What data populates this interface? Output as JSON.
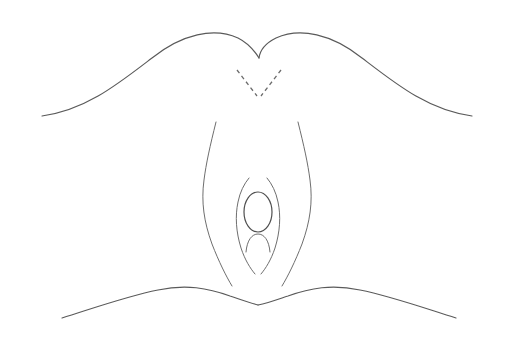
{
  "figure": {
    "title": "Perineal anatomy line diagram with midline instrument",
    "canvas": {
      "width": 514,
      "height": 348,
      "background": "#ffffff"
    },
    "caption": "",
    "labels": []
  },
  "palette": {
    "background": "#ffffff",
    "outline": "#5a5a5a",
    "outline_light": "#6e6e6e",
    "inner_detail": "#4f4f4f",
    "dashed_guide": "#6b6b6b",
    "instrument_core": "#e0703f",
    "instrument_edge": "#a83a18",
    "instrument_mid": "#c24f23"
  },
  "elements": {
    "thigh_upper_left": {
      "name": "Left upper thigh / mons contour",
      "path": "M 42 116 C 86 110 118 84 152 58 C 182 34 214 27 238 38 C 248 43 254 50 259 58"
    },
    "thigh_upper_right": {
      "name": "Right upper thigh / mons contour",
      "path": "M 472 116 C 428 110 396 84 362 58 C 332 34 300 27 276 38 C 266 43 260 50 259 58"
    },
    "thigh_lower_left": {
      "name": "Left lower thigh contour",
      "path": "M 62 318 C 100 306 128 296 158 290 C 186 284 208 288 230 296 C 242 300 250 303 258 305"
    },
    "thigh_lower_right": {
      "name": "Right lower thigh contour",
      "path": "M 456 318 C 418 306 390 296 360 290 C 332 284 310 288 288 296 C 276 300 268 303 258 305"
    },
    "labia_majora_left": {
      "name": "Left labia majora outer fold",
      "path": "M 216 122 C 210 146 206 164 204 180 C 201 202 204 222 212 244 C 219 262 226 276 232 286"
    },
    "labia_majora_right": {
      "name": "Right labia majora outer fold",
      "path": "M 298 122 C 304 146 308 164 310 180 C 313 202 310 222 302 244 C 295 262 288 276 282 286"
    },
    "labia_minora_left": {
      "name": "Left labia minora inner fold",
      "path": "M 249 178 C 244 184 240 192 238 202 C 235 216 236 232 241 248 C 245 260 250 268 255 274"
    },
    "labia_minora_right": {
      "name": "Right labia minora inner fold",
      "path": "M 267 178 C 272 184 276 192 278 202 C 281 216 280 232 275 248 C 271 260 266 268 261 274"
    },
    "introitus_oval": {
      "name": "Vaginal introitus oval",
      "cx": 258,
      "cy": 212,
      "rx": 14,
      "ry": 20
    },
    "fourchette_arc": {
      "name": "Fourchette / perineal arc",
      "path": "M 246 252 C 247 240 252 234 258 234 C 264 234 269 240 270 252"
    },
    "dashed_guide_left": {
      "name": "Left dashed insertion-angle guide",
      "path": "M 237 70 L 257 96"
    },
    "dashed_guide_right": {
      "name": "Right dashed insertion-angle guide",
      "path": "M 281 70 L 261 96"
    },
    "instrument": {
      "name": "Midline instrument / catheter shaft",
      "x": 258,
      "y_top": 74,
      "y_bottom": 200,
      "width": 4
    }
  }
}
